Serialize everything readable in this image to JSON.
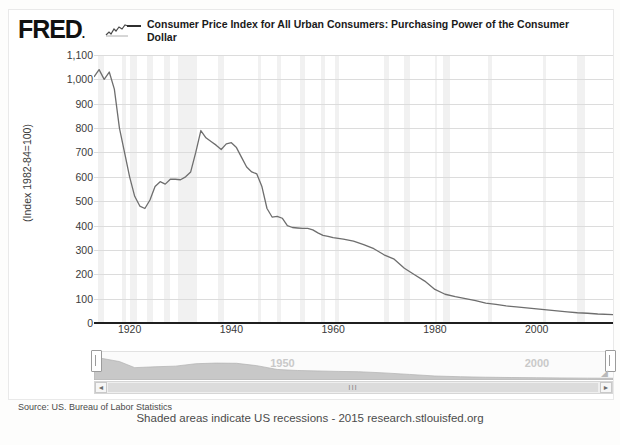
{
  "page": {
    "top_cut_text": "",
    "footer_note": "Shaded areas indicate US recessions - 2015 research.stlouisfed.org"
  },
  "header": {
    "logo": "FRED",
    "logo_mark": "sparkline-icon",
    "legend": [
      {
        "label": "Consumer Price Index for All Urban Consumers: Purchasing Power of the Consumer Dollar",
        "color": "#2f2f2f",
        "marker": "line-dash"
      }
    ]
  },
  "source": {
    "text": "Source: US. Bureau of Labor Statistics"
  },
  "navigator": {
    "labels": [
      "1950",
      "2000"
    ],
    "left_handle": "nav-handle-left",
    "right_handle": "nav-handle-right",
    "scroll_left": "◄",
    "scroll_right": "►",
    "grip": "III"
  },
  "chart_data": {
    "type": "line",
    "title": "",
    "subtitle": "",
    "xlabel": "",
    "ylabel": "(Index 1982-84=100)",
    "ylim": [
      0,
      1100
    ],
    "xlim": [
      1913,
      2015
    ],
    "grid": true,
    "legend_position": "top",
    "yticks": [
      "0",
      "100",
      "200",
      "300",
      "400",
      "500",
      "600",
      "700",
      "800",
      "900",
      "1,000",
      "1,100"
    ],
    "ytick_values": [
      0,
      100,
      200,
      300,
      400,
      500,
      600,
      700,
      800,
      900,
      1000,
      1100
    ],
    "xticks": [
      "1920",
      "1940",
      "1960",
      "1980",
      "2000"
    ],
    "xtick_values": [
      1920,
      1940,
      1960,
      1980,
      2000
    ],
    "line_color": "#6e6e6e",
    "recession_color": "#ececec",
    "series": [
      {
        "name": "Consumer Price Index for All Urban Consumers: Purchasing Power of the Consumer Dollar",
        "color": "#6e6e6e",
        "x": [
          1913,
          1914,
          1915,
          1916,
          1917,
          1918,
          1919,
          1920,
          1921,
          1922,
          1923,
          1924,
          1925,
          1926,
          1927,
          1928,
          1929,
          1930,
          1931,
          1932,
          1933,
          1934,
          1935,
          1936,
          1937,
          1938,
          1939,
          1940,
          1941,
          1942,
          1943,
          1944,
          1945,
          1946,
          1947,
          1948,
          1949,
          1950,
          1951,
          1952,
          1953,
          1954,
          1955,
          1956,
          1957,
          1958,
          1959,
          1960,
          1962,
          1964,
          1966,
          1968,
          1970,
          1972,
          1974,
          1976,
          1978,
          1980,
          1982,
          1984,
          1986,
          1988,
          1990,
          1992,
          1994,
          1996,
          1998,
          2000,
          2002,
          2004,
          2006,
          2008,
          2010,
          2012,
          2015
        ],
        "values": [
          1010,
          1040,
          1000,
          1030,
          960,
          800,
          700,
          600,
          520,
          480,
          470,
          505,
          560,
          580,
          570,
          590,
          590,
          588,
          600,
          620,
          700,
          790,
          760,
          745,
          730,
          712,
          735,
          740,
          720,
          680,
          640,
          620,
          612,
          560,
          470,
          435,
          438,
          430,
          400,
          392,
          390,
          388,
          388,
          382,
          370,
          360,
          356,
          350,
          344,
          336,
          322,
          305,
          280,
          262,
          225,
          198,
          172,
          138,
          118,
          108,
          100,
          92,
          82,
          76,
          70,
          66,
          62,
          58,
          54,
          50,
          46,
          42,
          40,
          37,
          34
        ]
      }
    ],
    "recessions": [
      {
        "start": 1913.8,
        "end": 1914.9
      },
      {
        "start": 1918.6,
        "end": 1919.2
      },
      {
        "start": 1920.1,
        "end": 1921.5
      },
      {
        "start": 1923.4,
        "end": 1924.5
      },
      {
        "start": 1926.8,
        "end": 1927.9
      },
      {
        "start": 1929.6,
        "end": 1933.2
      },
      {
        "start": 1937.4,
        "end": 1938.5
      },
      {
        "start": 1945.2,
        "end": 1945.8
      },
      {
        "start": 1948.9,
        "end": 1949.8
      },
      {
        "start": 1953.5,
        "end": 1954.4
      },
      {
        "start": 1957.6,
        "end": 1958.4
      },
      {
        "start": 1960.3,
        "end": 1961.1
      },
      {
        "start": 1969.9,
        "end": 1970.9
      },
      {
        "start": 1973.9,
        "end": 1975.2
      },
      {
        "start": 1980.1,
        "end": 1980.5
      },
      {
        "start": 1981.5,
        "end": 1982.9
      },
      {
        "start": 1990.5,
        "end": 1991.2
      },
      {
        "start": 2001.2,
        "end": 2001.8
      },
      {
        "start": 2007.9,
        "end": 2009.5
      }
    ],
    "navigator_series": {
      "x": [
        1913,
        1918,
        1921,
        1925,
        1929,
        1933,
        1937,
        1941,
        1945,
        1949,
        1953,
        1957,
        1961,
        1965,
        1970,
        1975,
        1980,
        1985,
        1990,
        1995,
        2000,
        2005,
        2010,
        2015
      ],
      "values": [
        1010,
        800,
        520,
        560,
        590,
        700,
        730,
        720,
        612,
        438,
        390,
        370,
        348,
        334,
        280,
        210,
        138,
        104,
        82,
        68,
        58,
        48,
        40,
        34
      ]
    }
  }
}
